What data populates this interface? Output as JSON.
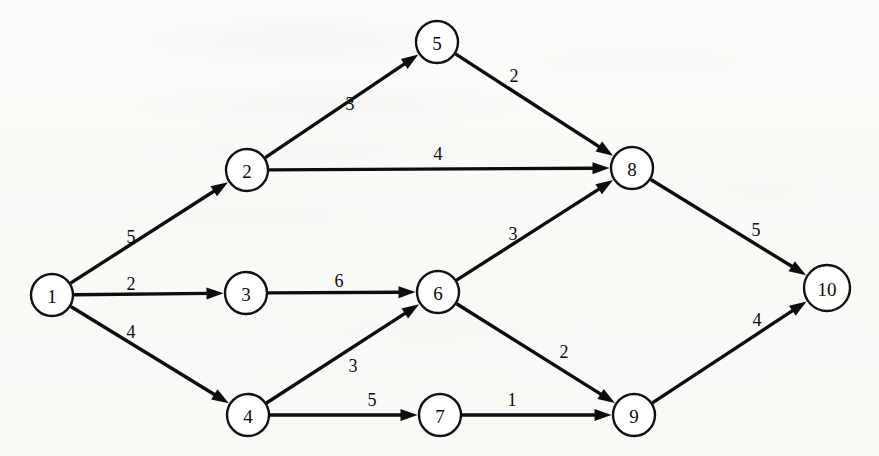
{
  "diagram": {
    "background_color": "#fbfbf9",
    "ink_color": "#0d0d0d",
    "node_fill": "#ffffff"
  },
  "chart_data": {
    "type": "diagram",
    "graph_type": "directed-weighted-graph",
    "title": "",
    "nodes": [
      {
        "id": "1",
        "label": "1",
        "x": 52,
        "y": 295,
        "r": 21
      },
      {
        "id": "2",
        "label": "2",
        "x": 247,
        "y": 170,
        "r": 21
      },
      {
        "id": "3",
        "label": "3",
        "x": 246,
        "y": 293,
        "r": 21
      },
      {
        "id": "4",
        "label": "4",
        "x": 248,
        "y": 415,
        "r": 21
      },
      {
        "id": "5",
        "label": "5",
        "x": 437,
        "y": 42,
        "r": 21
      },
      {
        "id": "6",
        "label": "6",
        "x": 438,
        "y": 292,
        "r": 21
      },
      {
        "id": "7",
        "label": "7",
        "x": 440,
        "y": 415,
        "r": 21
      },
      {
        "id": "8",
        "label": "8",
        "x": 632,
        "y": 168,
        "r": 21
      },
      {
        "id": "9",
        "label": "9",
        "x": 634,
        "y": 415,
        "r": 21
      },
      {
        "id": "10",
        "label": "10",
        "x": 827,
        "y": 288,
        "r": 23
      }
    ],
    "edges": [
      {
        "from": "1",
        "to": "2",
        "weight": "5",
        "label_x": 131,
        "label_y": 237
      },
      {
        "from": "1",
        "to": "3",
        "weight": "2",
        "label_x": 131,
        "label_y": 284
      },
      {
        "from": "1",
        "to": "4",
        "weight": "4",
        "label_x": 131,
        "label_y": 332
      },
      {
        "from": "2",
        "to": "5",
        "weight": "3",
        "label_x": 350,
        "label_y": 104
      },
      {
        "from": "2",
        "to": "8",
        "weight": "4",
        "label_x": 438,
        "label_y": 154
      },
      {
        "from": "3",
        "to": "6",
        "weight": "6",
        "label_x": 339,
        "label_y": 281
      },
      {
        "from": "4",
        "to": "6",
        "weight": "3",
        "label_x": 353,
        "label_y": 366
      },
      {
        "from": "4",
        "to": "7",
        "weight": "5",
        "label_x": 372,
        "label_y": 400
      },
      {
        "from": "5",
        "to": "8",
        "weight": "2",
        "label_x": 514,
        "label_y": 76
      },
      {
        "from": "6",
        "to": "8",
        "weight": "3",
        "label_x": 513,
        "label_y": 234
      },
      {
        "from": "6",
        "to": "9",
        "weight": "2",
        "label_x": 564,
        "label_y": 352
      },
      {
        "from": "7",
        "to": "9",
        "weight": "1",
        "label_x": 512,
        "label_y": 400
      },
      {
        "from": "8",
        "to": "10",
        "weight": "5",
        "label_x": 756,
        "label_y": 230
      },
      {
        "from": "9",
        "to": "10",
        "weight": "4",
        "label_x": 757,
        "label_y": 320
      }
    ],
    "node_count": 10,
    "edge_count": 14,
    "xlabel": "",
    "ylabel": "",
    "legend": []
  }
}
